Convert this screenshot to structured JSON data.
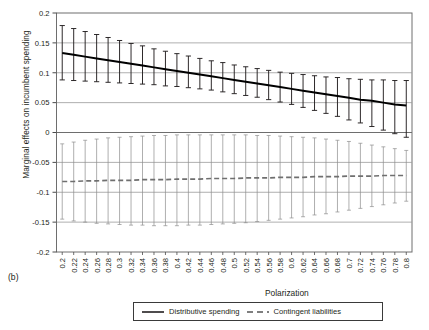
{
  "figure": {
    "panel_label": "(b)",
    "xlabel": "Polarization",
    "ylabel": "Marginal effects on incumbent spending"
  },
  "legend": {
    "items": [
      {
        "label": "Distributive spending",
        "style": "solid",
        "color": "#231f20"
      },
      {
        "label": "Contingent liabilities",
        "style": "dashed",
        "color": "#8c8c8c"
      }
    ]
  },
  "chart_data": {
    "type": "line",
    "title": "",
    "xlabel": "Polarization",
    "ylabel": "Marginal effects on incumbent spending",
    "xlim": [
      0.19,
      0.81
    ],
    "ylim": [
      -0.2,
      0.2
    ],
    "grid": true,
    "legend_position": "bottom",
    "ytick_labels": [
      "0.2",
      "0.15",
      "0.1",
      "0.05",
      "0",
      "-0.05",
      "-0.1",
      "-0.15",
      "-0.2"
    ],
    "ytick_values": [
      0.2,
      0.15,
      0.1,
      0.05,
      0,
      -0.05,
      -0.1,
      -0.15,
      -0.2
    ],
    "xtick_labels": [
      "0.2",
      "0.22",
      "0.24",
      "0.26",
      "0.28",
      "0.3",
      "0.32",
      "0.34",
      "0.36",
      "0.38",
      "0.4",
      "0.42",
      "0.44",
      "0.46",
      "0.48",
      "0.5",
      "0.52",
      "0.54",
      "0.56",
      "0.58",
      "0.6",
      "0.62",
      "0.64",
      "0.66",
      "0.68",
      "0.7",
      "0.72",
      "0.74",
      "0.76",
      "0.78",
      "0.8"
    ],
    "x": [
      0.2,
      0.22,
      0.24,
      0.26,
      0.28,
      0.3,
      0.32,
      0.34,
      0.36,
      0.38,
      0.4,
      0.42,
      0.44,
      0.46,
      0.48,
      0.5,
      0.52,
      0.54,
      0.56,
      0.58,
      0.6,
      0.62,
      0.64,
      0.66,
      0.68,
      0.7,
      0.72,
      0.74,
      0.76,
      0.78,
      0.8
    ],
    "series": [
      {
        "name": "Distributive spending",
        "style": "solid",
        "color": "#231f20",
        "values": [
          0.133,
          0.13,
          0.127,
          0.124,
          0.121,
          0.118,
          0.115,
          0.112,
          0.109,
          0.106,
          0.103,
          0.1,
          0.097,
          0.094,
          0.091,
          0.088,
          0.085,
          0.082,
          0.079,
          0.076,
          0.073,
          0.07,
          0.067,
          0.064,
          0.061,
          0.058,
          0.055,
          0.053,
          0.05,
          0.047,
          0.045
        ],
        "ci_lower": [
          0.088,
          0.087,
          0.086,
          0.085,
          0.084,
          0.083,
          0.082,
          0.081,
          0.08,
          0.078,
          0.077,
          0.075,
          0.073,
          0.071,
          0.068,
          0.065,
          0.062,
          0.059,
          0.055,
          0.051,
          0.047,
          0.042,
          0.037,
          0.032,
          0.027,
          0.021,
          0.016,
          0.01,
          0.004,
          -0.002,
          -0.008
        ],
        "ci_upper": [
          0.179,
          0.174,
          0.169,
          0.164,
          0.159,
          0.154,
          0.149,
          0.145,
          0.14,
          0.136,
          0.132,
          0.128,
          0.124,
          0.12,
          0.117,
          0.113,
          0.11,
          0.107,
          0.104,
          0.101,
          0.099,
          0.097,
          0.095,
          0.093,
          0.092,
          0.09,
          0.089,
          0.088,
          0.088,
          0.087,
          0.087
        ]
      },
      {
        "name": "Contingent liabilities",
        "style": "dashed",
        "color": "#8c8c8c",
        "values": [
          -0.082,
          -0.082,
          -0.081,
          -0.081,
          -0.08,
          -0.08,
          -0.08,
          -0.079,
          -0.079,
          -0.079,
          -0.078,
          -0.078,
          -0.078,
          -0.077,
          -0.077,
          -0.077,
          -0.076,
          -0.076,
          -0.076,
          -0.075,
          -0.075,
          -0.075,
          -0.074,
          -0.074,
          -0.074,
          -0.073,
          -0.073,
          -0.073,
          -0.072,
          -0.072,
          -0.072
        ],
        "ci_lower": [
          -0.145,
          -0.148,
          -0.15,
          -0.152,
          -0.153,
          -0.154,
          -0.155,
          -0.155,
          -0.156,
          -0.156,
          -0.156,
          -0.155,
          -0.155,
          -0.154,
          -0.153,
          -0.152,
          -0.151,
          -0.149,
          -0.147,
          -0.145,
          -0.143,
          -0.141,
          -0.138,
          -0.136,
          -0.133,
          -0.13,
          -0.127,
          -0.124,
          -0.121,
          -0.118,
          -0.115
        ],
        "ci_upper": [
          -0.019,
          -0.016,
          -0.013,
          -0.011,
          -0.009,
          -0.008,
          -0.007,
          -0.006,
          -0.005,
          -0.005,
          -0.004,
          -0.004,
          -0.004,
          -0.004,
          -0.004,
          -0.004,
          -0.004,
          -0.005,
          -0.005,
          -0.006,
          -0.007,
          -0.008,
          -0.009,
          -0.011,
          -0.013,
          -0.015,
          -0.018,
          -0.021,
          -0.024,
          -0.027,
          -0.03
        ]
      }
    ]
  }
}
